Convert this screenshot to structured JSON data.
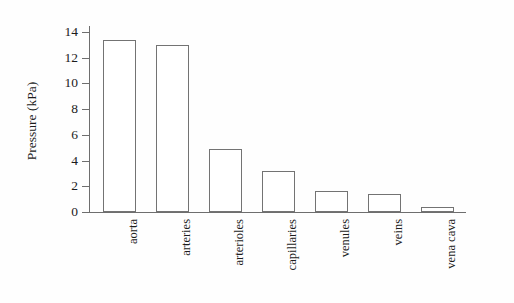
{
  "chart_data": {
    "type": "bar",
    "title": "",
    "xlabel": "",
    "ylabel": "Pressure (kPa)",
    "categories": [
      "aorta",
      "arteries",
      "arterioles",
      "capillaries",
      "venules",
      "veins",
      "vena cava"
    ],
    "values": [
      13.4,
      13.0,
      4.9,
      3.2,
      1.6,
      1.4,
      0.4
    ],
    "ylim": [
      0,
      14
    ],
    "yticks": [
      0,
      2,
      4,
      6,
      8,
      10,
      12,
      14
    ],
    "ytick_labels": [
      "0",
      "2",
      "4",
      "6",
      "8",
      "10",
      "12",
      "14"
    ],
    "grid": false,
    "legend": "none",
    "bar_fill_color": "#ffffff",
    "bar_edge_color": "#737373",
    "axis_color": "#6e6e6e",
    "text_color": "#1c1c1c",
    "background_color": "#fefefe"
  },
  "figure": {
    "background_note": ""
  }
}
